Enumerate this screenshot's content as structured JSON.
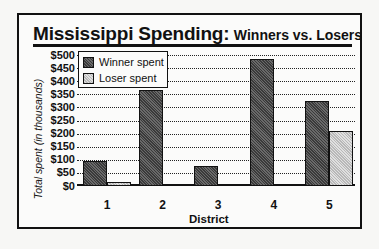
{
  "chart_data": {
    "type": "bar",
    "title": "Mississippi Spending:",
    "subtitle": "Winners vs. Losers",
    "xlabel": "District",
    "ylabel": "Total spent (in thousands)",
    "categories": [
      "1",
      "2",
      "3",
      "4",
      "5"
    ],
    "series": [
      {
        "name": "Winner spent",
        "values": [
          95,
          365,
          75,
          485,
          325
        ],
        "color": "#4a4a4a"
      },
      {
        "name": "Loser spent",
        "values": [
          15,
          2,
          2,
          2,
          210
        ],
        "color": "#cccccc"
      }
    ],
    "yticks": [
      "$0",
      "$50",
      "$100",
      "$150",
      "$200",
      "$250",
      "$300",
      "$350",
      "$400",
      "$450",
      "$500"
    ],
    "ylim": [
      0,
      500
    ],
    "grid": true,
    "legend_position": "top-left"
  }
}
